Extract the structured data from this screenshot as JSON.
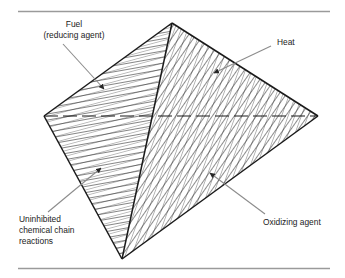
{
  "figure": {
    "rules": {
      "top_color": "#9a9a9a",
      "bottom_color": "#9a9a9a"
    },
    "colors": {
      "outline": "#1a1a1a",
      "hatch": "#2b2b2b",
      "leader": "#8c8c8c",
      "background": "#ffffff",
      "text": "#1a1a1a"
    },
    "vertices": {
      "apex": [
        172,
        23
      ],
      "left": [
        44,
        116
      ],
      "right": [
        318,
        116
      ],
      "bottom": [
        122,
        259
      ]
    },
    "faces": [
      {
        "id": "upper-left",
        "name": "fuel-face",
        "hatch_angle_deg": 80
      },
      {
        "id": "upper-right",
        "name": "heat-face",
        "hatch_angle_deg": 35
      },
      {
        "id": "lower-left",
        "name": "uninhibited-chain-reactions-face",
        "hatch_angle_deg": 75
      },
      {
        "id": "lower-right",
        "name": "oxidizing-agent-face",
        "hatch_angle_deg": 20
      }
    ],
    "labels": {
      "fuel": {
        "lines": [
          "Fuel",
          "(reducing agent)"
        ]
      },
      "heat": {
        "lines": [
          "Heat"
        ]
      },
      "chain_reactions": {
        "lines": [
          "Uninhibited",
          "chemical chain",
          "reactions"
        ]
      },
      "oxidizing_agent": {
        "lines": [
          "Oxidizing agent"
        ]
      }
    }
  }
}
